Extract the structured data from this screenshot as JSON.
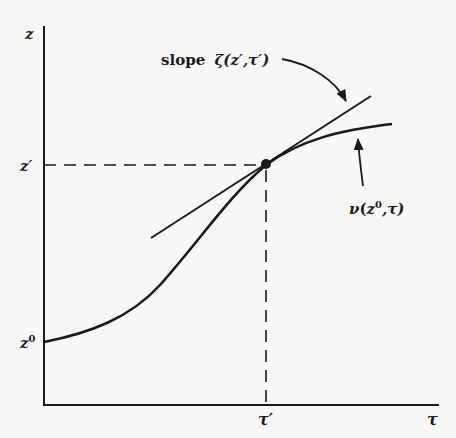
{
  "diagram": {
    "axes": {
      "y_label": "z",
      "x_label": "τ"
    },
    "y_ticks": {
      "z_prime": "z′",
      "z_zero_base": "z",
      "z_zero_sup": "0"
    },
    "x_ticks": {
      "tau_prime": "τ′"
    },
    "annotations": {
      "slope_word": "slope",
      "slope_expr": "ζ(z′,τ′)",
      "curve_nu": "ν",
      "curve_open": "(",
      "curve_z": "z",
      "curve_sup": "0",
      "curve_rest": ",τ)"
    },
    "colors": {
      "ink": "#1a1a1a",
      "background": "#f7f7f5"
    }
  }
}
